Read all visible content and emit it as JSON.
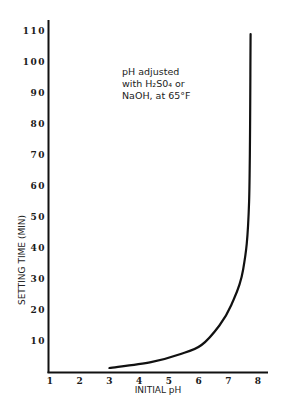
{
  "chart_data": {
    "type": "line",
    "title": "",
    "xlabel": "INITIAL pH",
    "ylabel": "SETTING TIME (MIN)",
    "xlim": [
      1,
      8
    ],
    "ylim": [
      0,
      110
    ],
    "x_ticks": [
      "1",
      "2",
      "3",
      "4",
      "5",
      "6",
      "7",
      "8"
    ],
    "y_ticks": [
      "10",
      "20",
      "30",
      "40",
      "50",
      "60",
      "70",
      "80",
      "90",
      "100",
      "110"
    ],
    "grid": false,
    "annotation": [
      "pH adjusted",
      "with H₂S0₄ or",
      "NaOH, at 65°F"
    ],
    "series": [
      {
        "name": "setting time",
        "x": [
          3.0,
          4.4,
          5.4,
          6.1,
          6.7,
          7.1,
          7.5,
          7.7,
          7.75
        ],
        "y": [
          1.3,
          3.2,
          5.8,
          8.7,
          15,
          21.6,
          33,
          55,
          109
        ]
      }
    ]
  }
}
